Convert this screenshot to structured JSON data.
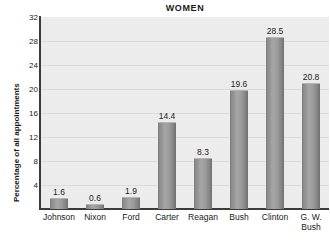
{
  "chart_data": {
    "type": "bar",
    "title": "WOMEN",
    "xlabel": "",
    "ylabel": "Percentage of all appointments",
    "categories": [
      "Johnson",
      "Nixon",
      "Ford",
      "Carter",
      "Reagan",
      "Bush",
      "Clinton",
      "G. W.\nBush"
    ],
    "values": [
      1.6,
      0.6,
      1.9,
      14.4,
      8.3,
      19.6,
      28.5,
      20.8
    ],
    "value_labels": [
      "1.6",
      "0.6",
      "1.9",
      "14.4",
      "8.3",
      "19.6",
      "28.5",
      "20.8"
    ],
    "ylim": [
      0,
      32
    ],
    "yticks": [
      4,
      8,
      12,
      16,
      20,
      24,
      28,
      32
    ],
    "ytick_labels": [
      "4",
      "8",
      "12",
      "16",
      "20",
      "24",
      "28",
      "32"
    ],
    "grid": true,
    "legend": false,
    "bar_color": "#909090",
    "plot_background": "#ececec",
    "axis_color": "#3b3b3b",
    "gridline_color": "#dcdcdc",
    "text_color": "#1a1a1a"
  }
}
